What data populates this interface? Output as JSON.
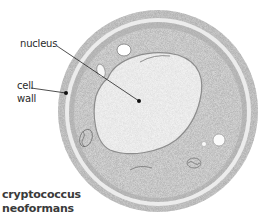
{
  "diagram": {
    "organism_title_line1": "cryptococcus",
    "organism_title_line2": "neoformans",
    "labels": {
      "nucleus": "nucleus",
      "cell_wall_line1": "cell",
      "cell_wall_line2": "wall"
    },
    "colors": {
      "background": "#ffffff",
      "ink": "#2a2a2a",
      "stipple_dark": "#8a8a8a",
      "stipple_mid": "#b5b5b5",
      "nucleus_fill": "#f2f2f2",
      "capsule_ring": "#e9e9e9"
    }
  }
}
